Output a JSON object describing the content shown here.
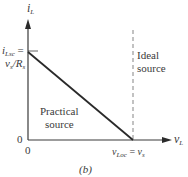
{
  "figure": {
    "caption": "(b)",
    "y_axis_label": {
      "main": "i",
      "sub": "L"
    },
    "x_axis_label": {
      "main": "v",
      "sub": "L"
    },
    "origin_labels": [
      "0",
      "0"
    ],
    "y_intercept_label": {
      "line1_main": "i",
      "line1_sub": "Lsc",
      "line1_suffix": " =",
      "line2_v": "v",
      "line2_v_sub": "s",
      "line2_slash": "/",
      "line2_R": "R",
      "line2_R_sub": "s"
    },
    "x_intercept_label": {
      "v": "v",
      "v_sub": "Loc",
      "eq": " = ",
      "vs": "v",
      "vs_sub": "s"
    },
    "practical_label": [
      "Practical",
      "source"
    ],
    "ideal_label": [
      "Ideal",
      "source"
    ],
    "colors": {
      "axis": "#3a3a3a",
      "practical_line": "#2a2a2a",
      "ideal_line": "#9a9a9a",
      "text": "#3a3a3a"
    }
  }
}
